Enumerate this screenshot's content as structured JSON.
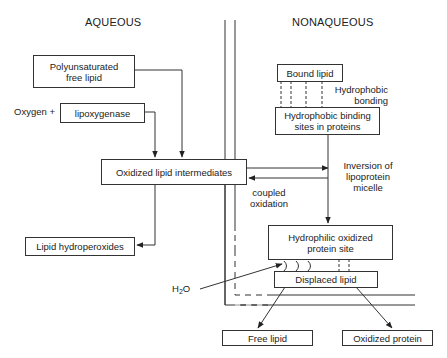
{
  "regions": {
    "aqueous": "AQUEOUS",
    "nonaqueous": "NONAQUEOUS"
  },
  "nodes": {
    "polyunsaturated": {
      "line1": "Polyunsaturated",
      "line2": "free lipid"
    },
    "oxygen_plus": "Oxygen +",
    "lipoxygenase": "lipoxygenase",
    "oxidized_intermediates": "Oxidized lipid intermediates",
    "lipid_hydroperoxides": "Lipid hydroperoxides",
    "bound_lipid": "Bound lipid",
    "hydrophobic_sites": {
      "line1": "Hydrophobic binding",
      "line2": "sites in proteins"
    },
    "hydrophilic_site": {
      "line1": "Hydrophilic oxidized",
      "line2": "protein site"
    },
    "displaced_lipid": "Displaced lipid",
    "free_lipid": "Free lipid",
    "oxidized_protein": "Oxidized protein",
    "water": {
      "h": "H",
      "sub": "2",
      "o": "O"
    }
  },
  "annotations": {
    "hydrophobic_bonding": {
      "line1": "Hydrophobic",
      "line2": "bonding"
    },
    "inversion": {
      "line1": "Inversion of",
      "line2": "lipoprotein",
      "line3": "micelle"
    },
    "coupled_oxidation": {
      "line1": "coupled",
      "line2": "oxidation"
    }
  },
  "colors": {
    "line": "#333333",
    "background": "#ffffff"
  }
}
